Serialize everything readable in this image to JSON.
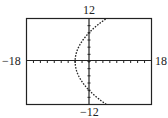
{
  "chart_data": {
    "type": "line",
    "title": "",
    "xlabel": "",
    "ylabel": "",
    "xlim": [
      -18,
      18
    ],
    "ylim": [
      -12,
      12
    ],
    "x_tick_step": 2,
    "y_tick_step": 2,
    "grid": false,
    "labels": {
      "xmin": "−18",
      "xmax": "18",
      "ymin": "−12",
      "ymax": "12"
    },
    "series": [
      {
        "name": "parabola y^2 = 16(x + 4)",
        "style": "dotted",
        "points": [
          [
            5,
            -12
          ],
          [
            2.25,
            -10
          ],
          [
            0,
            -8
          ],
          [
            -1.75,
            -6
          ],
          [
            -3,
            -4
          ],
          [
            -3.75,
            -2
          ],
          [
            -4,
            0
          ],
          [
            -3.75,
            2
          ],
          [
            -3,
            4
          ],
          [
            -1.75,
            6
          ],
          [
            0,
            8
          ],
          [
            2.25,
            10
          ],
          [
            5,
            12
          ]
        ]
      }
    ]
  }
}
